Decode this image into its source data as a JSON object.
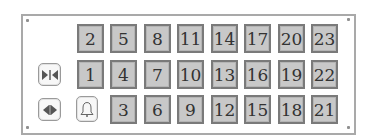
{
  "panel": {
    "tiles": {
      "row1": [
        "2",
        "5",
        "8",
        "11",
        "14",
        "17",
        "20",
        "23"
      ],
      "row2": [
        "1",
        "4",
        "7",
        "10",
        "13",
        "16",
        "19",
        "22"
      ],
      "row3": [
        "3",
        "6",
        "9",
        "12",
        "15",
        "18",
        "21"
      ]
    },
    "buttons": [
      {
        "name": "collapse-horizontal",
        "icon": "arrows-inward-icon"
      },
      {
        "name": "expand-horizontal",
        "icon": "arrows-outward-icon"
      },
      {
        "name": "bell",
        "icon": "bell-icon"
      }
    ],
    "colors": {
      "tile_fill": "#c8c8c8",
      "tile_border": "#7a7a7a",
      "frame_border": "#a9a9a9"
    }
  }
}
